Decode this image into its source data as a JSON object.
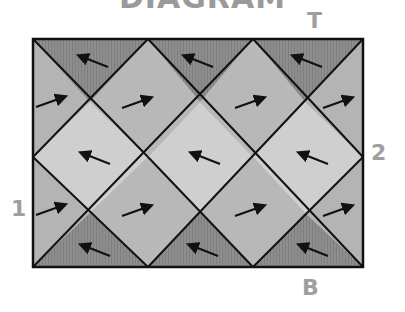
{
  "diagram": {
    "title": "DIAGRAM",
    "labels": {
      "top": "T",
      "bottom": "B",
      "left": "1",
      "right": "2"
    },
    "colors": {
      "dark": "#8c8c8c",
      "mid": "#b4b4b4",
      "light": "#cfcfcf",
      "line": "#111111",
      "label": "#9e9e9e"
    },
    "regions": [
      {
        "name": "top-dark-triangle-1",
        "shade": "dark",
        "arrow": "left-up"
      },
      {
        "name": "top-dark-triangle-2",
        "shade": "dark",
        "arrow": "left-up"
      },
      {
        "name": "top-dark-triangle-3",
        "shade": "dark",
        "arrow": "left-up"
      },
      {
        "name": "left-edge-triangle-upper",
        "shade": "mid",
        "arrow": "right-up"
      },
      {
        "name": "upper-diamond-1",
        "shade": "mid",
        "arrow": "right-up"
      },
      {
        "name": "upper-diamond-2",
        "shade": "mid",
        "arrow": "right-up"
      },
      {
        "name": "right-edge-triangle-upper",
        "shade": "mid",
        "arrow": "right-up"
      },
      {
        "name": "middle-diamond-1",
        "shade": "light",
        "arrow": "left-up"
      },
      {
        "name": "middle-diamond-2",
        "shade": "light",
        "arrow": "left-up"
      },
      {
        "name": "middle-diamond-3",
        "shade": "light",
        "arrow": "left-up"
      },
      {
        "name": "left-edge-triangle-lower",
        "shade": "mid",
        "arrow": "right-up"
      },
      {
        "name": "lower-diamond-1",
        "shade": "mid",
        "arrow": "right-up"
      },
      {
        "name": "lower-diamond-2",
        "shade": "mid",
        "arrow": "right-up"
      },
      {
        "name": "right-edge-triangle-lower",
        "shade": "mid",
        "arrow": "right-up"
      },
      {
        "name": "bottom-dark-triangle-1",
        "shade": "dark",
        "arrow": "left-up"
      },
      {
        "name": "bottom-dark-triangle-2",
        "shade": "dark",
        "arrow": "left-up"
      },
      {
        "name": "bottom-dark-triangle-3",
        "shade": "dark",
        "arrow": "left-up"
      }
    ]
  }
}
